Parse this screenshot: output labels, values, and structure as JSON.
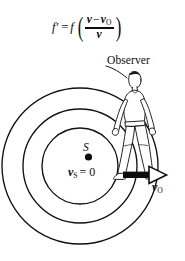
{
  "figure": {
    "background_color": "#ffffff",
    "ink_color": "#0d0d0d",
    "formula": {
      "lhs_f": "f",
      "lhs_prime": "′",
      "equals": "=",
      "rhs_f": "f",
      "paren_open": "(",
      "paren_close": ")",
      "numerator_v": "v",
      "numerator_minus": "−",
      "numerator_vo": "v",
      "numerator_vo_sub": "O",
      "denominator": "v",
      "plain_text": "f′ = f((v − vO)/v)"
    },
    "labels": {
      "observer": "Observer",
      "source": "S",
      "source_speed_v": "v",
      "source_speed_sub": "S",
      "source_speed_eq": "= 0",
      "source_speed_full": "vS = 0",
      "observer_speed_v": "v",
      "observer_speed_sub": "O",
      "observer_speed_full": "vO"
    },
    "wavefronts": {
      "count": 3,
      "center_x": 80,
      "center_y": 166,
      "radii": [
        38,
        57,
        78
      ],
      "stroke_width": 1.3
    },
    "arrow": {
      "direction": "right",
      "x_start": 123,
      "x_end": 166,
      "y": 175
    },
    "observer_figure": {
      "description": "walking-person",
      "pose": "side-view walking right"
    },
    "leader_line": {
      "from": "observer-label",
      "to": "observer-figure-head"
    }
  }
}
